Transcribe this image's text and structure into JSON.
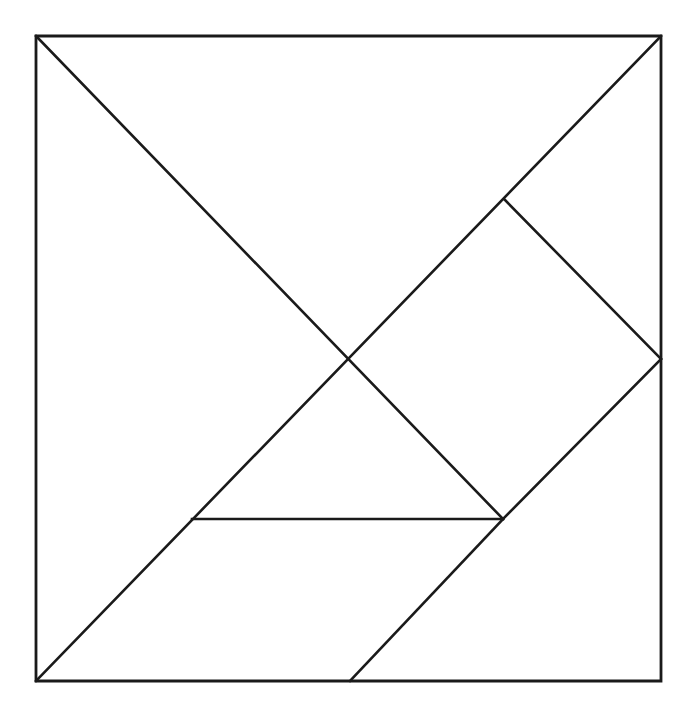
{
  "page": {
    "width": 697,
    "height": 718,
    "background_color": "#ffffff",
    "line_color": "#1a1a1a",
    "line_width": 2.6
  },
  "figure": {
    "name": "tangram-square",
    "bounds": {
      "x": 36,
      "y": 36,
      "width": 625,
      "height": 645
    },
    "points": {
      "top_left": {
        "id": "TL",
        "x": 36,
        "y": 36
      },
      "top_right": {
        "id": "TR",
        "x": 661,
        "y": 36
      },
      "bottom_left": {
        "id": "BL",
        "x": 36,
        "y": 681
      },
      "bottom_right": {
        "id": "BR",
        "x": 661,
        "y": 681
      },
      "center": {
        "id": "C",
        "x": 350,
        "y": 359
      },
      "right_mid": {
        "id": "R",
        "x": 661,
        "y": 359
      },
      "bottom_mid": {
        "id": "B",
        "x": 350,
        "y": 681
      },
      "square_top": {
        "id": "S",
        "x": 505,
        "y": 200
      },
      "lower_node": {
        "id": "P",
        "x": 503,
        "y": 519
      },
      "horiz_left": {
        "id": "H",
        "x": 192,
        "y": 519
      }
    },
    "outline": {
      "name": "square-border",
      "path": "M 36 36 L 661 36 L 661 681 L 36 681 Z"
    },
    "cut_lines": [
      {
        "name": "main-diagonal",
        "x1": 36,
        "y1": 36,
        "x2": 503,
        "y2": 519
      },
      {
        "name": "anti-diagonal",
        "x1": 661,
        "y1": 36,
        "x2": 36,
        "y2": 681
      },
      {
        "name": "square-upper-edge",
        "x1": 505,
        "y1": 200,
        "x2": 661,
        "y2": 359
      },
      {
        "name": "square-lower-edge",
        "x1": 661,
        "y1": 359,
        "x2": 503,
        "y2": 519
      },
      {
        "name": "horizontal-cut",
        "x1": 192,
        "y1": 519,
        "x2": 503,
        "y2": 519
      },
      {
        "name": "parallelogram-edge",
        "x1": 503,
        "y1": 519,
        "x2": 350,
        "y2": 681
      }
    ],
    "pieces": [
      {
        "name": "large-triangle-upper-left",
        "path": "M 36 36 L 350 359 L 36 681 Z"
      },
      {
        "name": "large-triangle-upper-right",
        "path": "M 36 36 L 661 36 L 350 359 Z"
      },
      {
        "name": "medium-triangle",
        "path": "M 192 519 L 503 519 L 350 359 Z"
      },
      {
        "name": "small-triangle-upper",
        "path": "M 505 200 L 661 359 L 350 359 Z"
      },
      {
        "name": "small-triangle-lower",
        "path": "M 661 359 L 503 519 L 350 359 Z"
      },
      {
        "name": "square-piece",
        "path": "M 505 200 L 661 359 L 503 519 L 350 359 Z"
      },
      {
        "name": "parallelogram-piece",
        "path": "M 192 519 L 503 519 L 350 681 L 36 681 Z"
      }
    ]
  }
}
